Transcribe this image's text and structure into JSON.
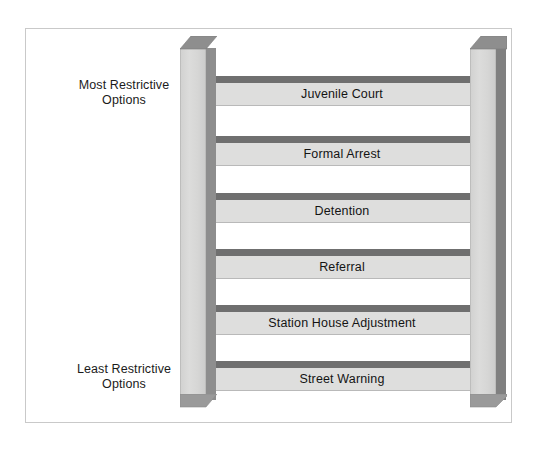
{
  "figure": {
    "background_color": "#ffffff",
    "border_color": "#c9c9c9"
  },
  "captions": {
    "top": {
      "line1": "Most Restrictive",
      "line2": "Options"
    },
    "bottom": {
      "line1": "Least Restrictive",
      "line2": "Options"
    }
  },
  "ladder": {
    "rail_face_color": "#dcdcdb",
    "rail_edge_color": "#8e8e8e",
    "rung_face_color": "#dededd",
    "rung_top_color": "#6f6f6f",
    "label_color": "#141414",
    "rungs": [
      {
        "label": "Juvenile Court",
        "rank": 6,
        "restrictiveness": "most"
      },
      {
        "label": "Formal Arrest",
        "rank": 5,
        "restrictiveness": "high"
      },
      {
        "label": "Detention",
        "rank": 4,
        "restrictiveness": "moderate-high"
      },
      {
        "label": "Referral",
        "rank": 3,
        "restrictiveness": "moderate"
      },
      {
        "label": "Station House Adjustment",
        "rank": 2,
        "restrictiveness": "low"
      },
      {
        "label": "Street Warning",
        "rank": 1,
        "restrictiveness": "least"
      }
    ]
  }
}
